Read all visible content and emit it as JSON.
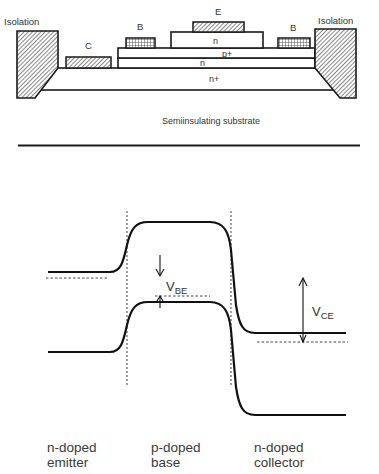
{
  "cross_section": {
    "title": "Semiinsulating substrate",
    "isolation_left": "Isolation",
    "isolation_right": "Isolation",
    "contacts": {
      "collector": "C",
      "base_left": "B",
      "emitter": "E",
      "base_right": "B"
    },
    "layers": {
      "emitter_cap": "n",
      "base": "p+",
      "collector": "n",
      "subcollector": "n+"
    }
  },
  "band_diagram": {
    "v_be": {
      "main": "V",
      "sub": "BE"
    },
    "v_ce": {
      "main": "V",
      "sub": "CE"
    },
    "regions": [
      {
        "line1": "n-doped",
        "line2": "emitter"
      },
      {
        "line1": "p-doped",
        "line2": "base"
      },
      {
        "line1": "n-doped",
        "line2": "collector"
      }
    ]
  },
  "colors": {
    "stroke": "#1a1a1a",
    "text": "#333333",
    "background": "#ffffff"
  }
}
